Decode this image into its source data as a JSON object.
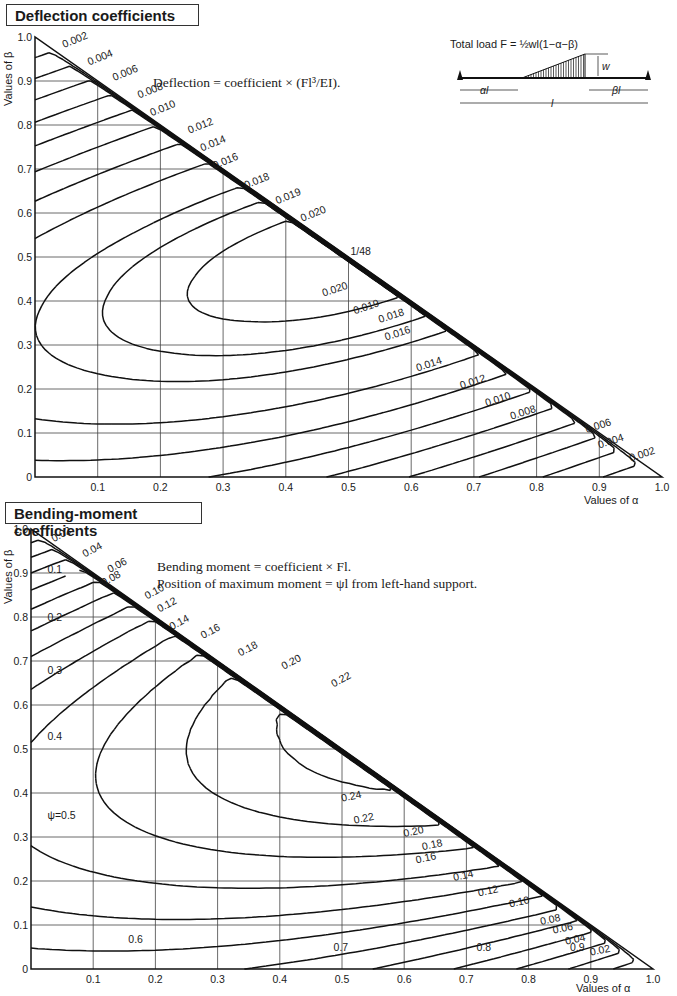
{
  "top": {
    "title": "Deflection coefficients",
    "note": "Deflection = coefficient × (Fl³/EI).",
    "ylabel": "Values of β",
    "xlabel": "Values of α",
    "peak_label": "1/48",
    "load_caption": "Total load F = ½wl(1−α−β)",
    "diagram_labels": {
      "w": "w",
      "al": "αl",
      "bl": "βl",
      "l": "l"
    }
  },
  "bottom": {
    "title": "Bending-moment coefficients",
    "note_line1": "Bending moment = coefficient × Fl.",
    "note_line2": "Position of maximum moment = ψl from left-hand support.",
    "ylabel": "Values of β",
    "xlabel": "Values of α"
  },
  "chart_data": [
    {
      "type": "line",
      "title": "Deflection coefficients",
      "subtitle": "Deflection = coefficient × (Fl³/EI)",
      "xlabel": "Values of α",
      "ylabel": "Values of β",
      "xlim": [
        0,
        1.0
      ],
      "ylim": [
        0,
        1.0
      ],
      "xticks": [
        "0.1",
        "0.2",
        "0.3",
        "0.4",
        "0.5",
        "0.6",
        "0.7",
        "0.8",
        "0.9",
        "1.0"
      ],
      "yticks": [
        "0",
        "0.1",
        "0.2",
        "0.3",
        "0.4",
        "0.5",
        "0.6",
        "0.7",
        "0.8",
        "0.9",
        "1.0"
      ],
      "grid": true,
      "domain": "triangle α + β ≤ 1",
      "contour_levels": [
        0.002,
        0.004,
        0.006,
        0.008,
        0.01,
        0.012,
        0.014,
        0.016,
        0.018,
        0.019,
        0.02
      ],
      "max_value": "1/48 at α=0.5, β=0.5",
      "annotations": [
        "1/48"
      ]
    },
    {
      "type": "line",
      "title": "Bending-moment coefficients",
      "subtitle": "Bending moment = coefficient × Fl; position of maximum moment = ψl from left-hand support",
      "xlabel": "Values of α",
      "ylabel": "Values of β",
      "xlim": [
        0,
        1.0
      ],
      "ylim": [
        0,
        1.0
      ],
      "xticks": [
        "0.1",
        "0.2",
        "0.3",
        "0.4",
        "0.5",
        "0.6",
        "0.7",
        "0.8",
        "0.9",
        "1.0"
      ],
      "yticks": [
        "0",
        "0.1",
        "0.2",
        "0.3",
        "0.4",
        "0.5",
        "0.6",
        "0.7",
        "0.8",
        "0.9",
        "1.0"
      ],
      "grid": true,
      "domain": "triangle α + β ≤ 1",
      "contour_levels_solid": [
        0.02,
        0.04,
        0.06,
        0.08,
        0.1,
        0.12,
        0.14,
        0.16,
        0.18,
        0.2,
        0.22,
        0.24
      ],
      "psi_levels_dashed": [
        0.1,
        0.2,
        0.3,
        0.4,
        0.5,
        0.6,
        0.7,
        0.8,
        0.9
      ]
    }
  ]
}
